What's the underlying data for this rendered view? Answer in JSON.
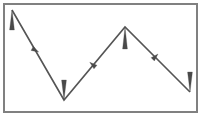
{
  "figure": {
    "title": "",
    "width": 202,
    "height": 118,
    "background_color": "#ffffff",
    "frame": {
      "name": "border-frame",
      "x": 4,
      "y": 4,
      "width": 193,
      "height": 108,
      "stroke_color": "#808080",
      "stroke_width": 2,
      "fill": "none"
    }
  },
  "chart_data": {
    "type": "line",
    "title": "",
    "xlabel": "",
    "ylabel": "",
    "xlim": [
      0,
      202
    ],
    "ylim": [
      118,
      0
    ],
    "grid": false,
    "legend": null,
    "series": [
      {
        "name": "zigzag-polyline",
        "color": "#555555",
        "line_width": 1.6,
        "x": [
          12,
          64,
          125,
          190
        ],
        "y": [
          10,
          100,
          27,
          92
        ],
        "points": [
          {
            "label": "start-peak",
            "x": 12,
            "y": 10
          },
          {
            "label": "valley-low",
            "x": 64,
            "y": 100
          },
          {
            "label": "mid-peak",
            "x": 125,
            "y": 27
          },
          {
            "label": "end-low",
            "x": 190,
            "y": 92
          }
        ]
      }
    ],
    "vertex_markers": [
      {
        "name": "marker-start",
        "x": 12,
        "y": 10,
        "direction": "up",
        "length": 20,
        "color": "#4a4a4a"
      },
      {
        "name": "marker-valley",
        "x": 64,
        "y": 100,
        "direction": "down",
        "length": 20,
        "color": "#4a4a4a"
      },
      {
        "name": "marker-peak",
        "x": 125,
        "y": 27,
        "direction": "up",
        "length": 22,
        "color": "#4a4a4a"
      },
      {
        "name": "marker-end",
        "x": 190,
        "y": 92,
        "direction": "down",
        "length": 20,
        "color": "#4a4a4a"
      }
    ],
    "segment_arrows": [
      {
        "name": "segment-arrow-1",
        "x": 35,
        "y": 50,
        "angle": 120,
        "color": "#4a4a4a"
      },
      {
        "name": "segment-arrow-2",
        "x": 93,
        "y": 65,
        "angle": -50,
        "color": "#4a4a4a"
      },
      {
        "name": "segment-arrow-3",
        "x": 155,
        "y": 57,
        "angle": 45,
        "color": "#4a4a4a"
      }
    ]
  }
}
